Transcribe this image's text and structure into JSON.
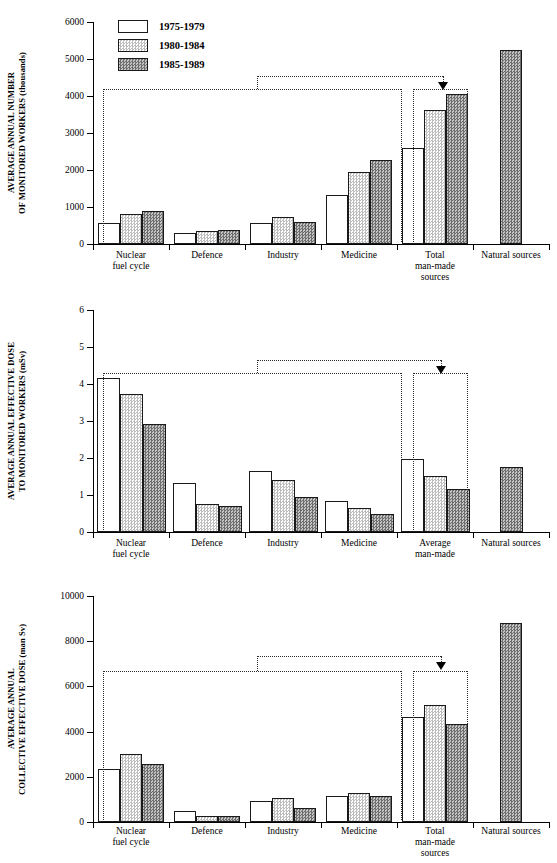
{
  "legend": {
    "position": "top-left-inside-panel-1",
    "entries": [
      {
        "label": "1975-1979",
        "swatch": "white-open"
      },
      {
        "label": "1980-1984",
        "swatch": "light-checker"
      },
      {
        "label": "1985-1989",
        "swatch": "dark-checker"
      }
    ]
  },
  "chart_data": [
    {
      "type": "bar",
      "title": "",
      "ylabel": "AVERAGE ANNUAL NUMBER\nOF MONITORED WORKERS (thousands)",
      "xlabel": "",
      "ylim": [
        0,
        6000
      ],
      "yticks": [
        0,
        1000,
        2000,
        3000,
        4000,
        5000,
        6000
      ],
      "ytick_labels": [
        "0",
        "1000",
        "2000",
        "3000",
        "4000",
        "5000",
        "6000"
      ],
      "grid": false,
      "legend_position": "top-left",
      "categories": [
        "Nuclear\nfuel cycle",
        "Defence",
        "Industry",
        "Medicine",
        "Total\nman-made\nsources",
        "Natural sources"
      ],
      "series": [
        {
          "name": "1975-1979",
          "values": [
            560,
            310,
            560,
            1320,
            2600,
            null
          ]
        },
        {
          "name": "1980-1984",
          "values": [
            800,
            340,
            720,
            1950,
            3610,
            null
          ]
        },
        {
          "name": "1985-1989",
          "values": [
            890,
            390,
            590,
            2270,
            4060,
            5250
          ]
        }
      ],
      "annotation": {
        "type": "bracket-arrow",
        "description": "dotted brackets grouping the man-made categories into Total man-made sources",
        "arrow": "down"
      }
    },
    {
      "type": "bar",
      "title": "",
      "ylabel": "AVERAGE ANNUAL EFFECTIVE DOSE\nTO MONITORED WORKERS (mSv)",
      "xlabel": "",
      "ylim": [
        0,
        6
      ],
      "yticks": [
        0,
        1,
        2,
        3,
        4,
        5,
        6
      ],
      "ytick_labels": [
        "0",
        "1",
        "2",
        "3",
        "4",
        "5",
        "6"
      ],
      "grid": false,
      "legend_position": "none",
      "categories": [
        "Nuclear\nfuel cycle",
        "Defence",
        "Industry",
        "Medicine",
        "Average\nman-made",
        "Natural sources"
      ],
      "series": [
        {
          "name": "1975-1979",
          "values": [
            4.15,
            1.32,
            1.66,
            0.84,
            1.96,
            null
          ]
        },
        {
          "name": "1980-1984",
          "values": [
            3.72,
            0.76,
            1.4,
            0.65,
            1.51,
            null
          ]
        },
        {
          "name": "1985-1989",
          "values": [
            2.92,
            0.7,
            0.95,
            0.5,
            1.17,
            1.77
          ]
        }
      ],
      "annotation": {
        "type": "bracket-arrow",
        "description": "dotted brackets grouping the man-made categories into Average man-made",
        "arrow": "down"
      }
    },
    {
      "type": "bar",
      "title": "",
      "ylabel": "AVERAGE ANNUAL\nCOLLECTIVE EFFECTIVE DOSE (man Sv)",
      "xlabel": "",
      "ylim": [
        0,
        10000
      ],
      "yticks": [
        0,
        2000,
        4000,
        6000,
        8000,
        10000
      ],
      "ytick_labels": [
        "0",
        "2000",
        "4000",
        "6000",
        "8000",
        "10000"
      ],
      "grid": false,
      "legend_position": "none",
      "categories": [
        "Nuclear\nfuel cycle",
        "Defence",
        "Industry",
        "Medicine",
        "Total\nman-made\nsources",
        "Natural sources"
      ],
      "series": [
        {
          "name": "1975-1979",
          "values": [
            2330,
            500,
            950,
            1150,
            4650,
            null
          ]
        },
        {
          "name": "1980-1984",
          "values": [
            3030,
            280,
            1060,
            1270,
            5180,
            null
          ]
        },
        {
          "name": "1985-1989",
          "values": [
            2550,
            250,
            610,
            1130,
            4350,
            8800
          ]
        }
      ],
      "annotation": {
        "type": "bracket-arrow",
        "description": "dotted brackets grouping the man-made categories into Total man-made sources",
        "arrow": "down"
      }
    }
  ]
}
